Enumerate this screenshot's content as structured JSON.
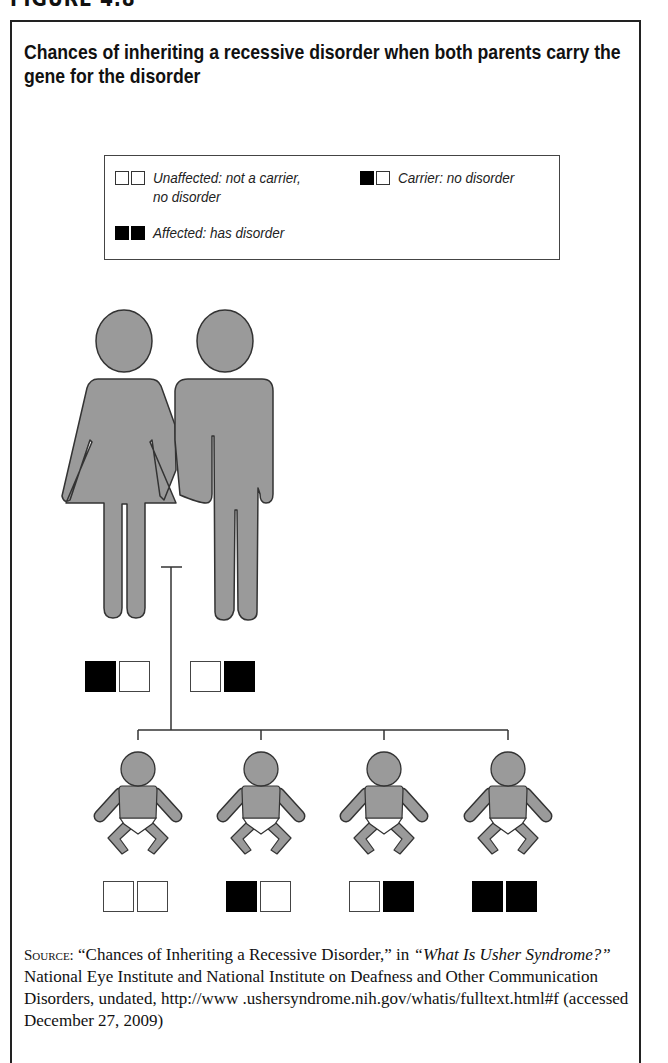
{
  "figure_label": "FIGURE 4.8",
  "title": "Chances of inheriting a recessive disorder when both parents carry the gene for the disorder",
  "legend": {
    "items": [
      {
        "genotype": [
          "white",
          "white"
        ],
        "label_line1": "Unaffected: not a carrier,",
        "label_line2": "no disorder"
      },
      {
        "genotype": [
          "black",
          "white"
        ],
        "label_line1": "Carrier: no disorder",
        "label_line2": ""
      },
      {
        "genotype": [
          "black",
          "black"
        ],
        "label_line1": "Affected: has disorder",
        "label_line2": ""
      }
    ]
  },
  "parents": [
    {
      "role": "mother",
      "genotype": [
        "black",
        "white"
      ],
      "status": "Carrier"
    },
    {
      "role": "father",
      "genotype": [
        "white",
        "black"
      ],
      "status": "Carrier"
    }
  ],
  "children": [
    {
      "genotype": [
        "white",
        "white"
      ],
      "status": "Unaffected"
    },
    {
      "genotype": [
        "black",
        "white"
      ],
      "status": "Carrier"
    },
    {
      "genotype": [
        "white",
        "black"
      ],
      "status": "Carrier"
    },
    {
      "genotype": [
        "black",
        "black"
      ],
      "status": "Affected"
    }
  ],
  "colors": {
    "figure_fill": "#9a9a9a",
    "figure_outline": "#333333",
    "gene_filled": "#000000",
    "gene_empty": "#ffffff"
  },
  "source": {
    "prefix": "Source:",
    "quote_title": "“Chances of Inheriting a Recessive Disorder,” in ",
    "italic_title": "“What Is Usher Syndrome?”",
    "rest": " National Eye Institute and National Institute on Deafness and Other Communication Disorders, undated, http://www .ushersyndrome.nih.gov/whatis/fulltext.html#f (accessed December 27, 2009)"
  }
}
